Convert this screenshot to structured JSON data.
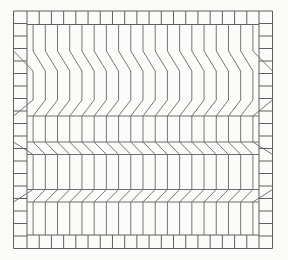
{
  "figure": {
    "kind": "scanned-mesh-figure",
    "background_color": "#fbfbf9",
    "interior_line_color": "#757575",
    "border_line_color": "#5f5f5f",
    "band_edge_line_color": "#6e6e6e",
    "stroke_width": 1,
    "canvas": {
      "width": 288,
      "height": 260
    },
    "frame": {
      "x0": 13.5,
      "y0": 11,
      "x1": 272.5,
      "y1": 248.5,
      "border_thickness": 13.5
    },
    "border_cells": {
      "rows": 19,
      "cols": 19,
      "row_pitch": 12.5,
      "col_pitch": 12.2105
    },
    "interior": {
      "columns": 19,
      "column_pitch": 12.2105,
      "first_column_offset": 0.5
    },
    "vertical_sections": [
      {
        "y_top": 24.5,
        "y_bottom": 51
      },
      {
        "y_top": 71,
        "y_bottom": 100
      },
      {
        "y_top": 116,
        "y_bottom": 142
      },
      {
        "y_top": 154.5,
        "y_bottom": 189.5
      },
      {
        "y_top": 202,
        "y_bottom": 235
      }
    ],
    "shear_bands": [
      {
        "y_top": 51,
        "y_bottom": 71,
        "direction": "right",
        "top_line": false,
        "bottom_line": false
      },
      {
        "y_top": 100,
        "y_bottom": 116,
        "direction": "left",
        "top_line": false,
        "bottom_line": true
      },
      {
        "y_top": 142,
        "y_bottom": 154.5,
        "direction": "right",
        "top_line": true,
        "bottom_line": true
      },
      {
        "y_top": 189.5,
        "y_bottom": 202,
        "direction": "left",
        "top_line": true,
        "bottom_line": true
      }
    ]
  }
}
